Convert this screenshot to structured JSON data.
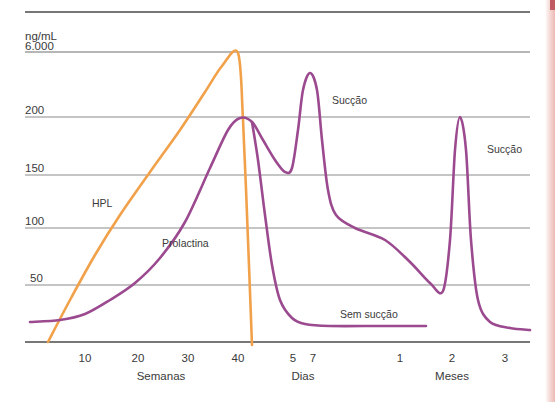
{
  "chart_data": {
    "type": "line",
    "title": "",
    "subtitle": "",
    "ylabel": "ng/mL",
    "yticks": [
      "6.000",
      "200",
      "150",
      "100",
      "50"
    ],
    "ytick_y": [
      52,
      117,
      175,
      228,
      285
    ],
    "ylim_note": "broken/non-linear axis: 6.000 at top, then 200,150,100,50",
    "grid": true,
    "legend_position": "inline-annotations",
    "x_sections": [
      {
        "name": "Semanas",
        "label": "Semanas",
        "ticks": [
          "10",
          "20",
          "30",
          "40"
        ],
        "tick_x": [
          85,
          138,
          188,
          238
        ]
      },
      {
        "name": "Dias",
        "label": "Dias",
        "ticks": [
          "5",
          "7"
        ],
        "tick_x": [
          293,
          313
        ]
      },
      {
        "name": "Meses",
        "label": "Meses",
        "ticks": [
          "1",
          "2",
          "3"
        ],
        "tick_x": [
          400,
          452,
          505
        ]
      }
    ],
    "series": [
      {
        "name": "HPL",
        "label": "HPL",
        "color": "#F2A14B",
        "label_x": 92,
        "label_y": 207,
        "description": "Rises from baseline at ~5 weeks, climbs steeply through 50/100/150/200, peaks at 6.000 at 40 weeks, then drops vertically to zero just after delivery.",
        "points": [
          {
            "x": 48,
            "y": 342
          },
          {
            "x": 70,
            "y": 300
          },
          {
            "x": 95,
            "y": 255
          },
          {
            "x": 120,
            "y": 215
          },
          {
            "x": 150,
            "y": 172
          },
          {
            "x": 180,
            "y": 130
          },
          {
            "x": 205,
            "y": 92
          },
          {
            "x": 222,
            "y": 66
          },
          {
            "x": 238,
            "y": 53
          },
          {
            "x": 243,
            "y": 120
          },
          {
            "x": 248,
            "y": 240
          },
          {
            "x": 252,
            "y": 345
          }
        ]
      },
      {
        "name": "Prolactina",
        "label": "Prolactina",
        "color": "#9B4A8F",
        "label_x": 162,
        "label_y": 247,
        "description": "Low baseline early pregnancy, rises from ~15 weeks, peaks at 200 ng/mL at term (40 weeks), falls after delivery; with suckling shows sharp spikes at day 7 and month 2; without suckling falls to low flat baseline.",
        "points": [
          {
            "x": 30,
            "y": 322
          },
          {
            "x": 60,
            "y": 320
          },
          {
            "x": 85,
            "y": 314
          },
          {
            "x": 110,
            "y": 300
          },
          {
            "x": 135,
            "y": 283
          },
          {
            "x": 160,
            "y": 258
          },
          {
            "x": 185,
            "y": 222
          },
          {
            "x": 210,
            "y": 168
          },
          {
            "x": 228,
            "y": 130
          },
          {
            "x": 240,
            "y": 118
          },
          {
            "x": 252,
            "y": 122
          },
          {
            "x": 263,
            "y": 140
          },
          {
            "x": 275,
            "y": 160
          },
          {
            "x": 285,
            "y": 172
          },
          {
            "x": 292,
            "y": 168
          },
          {
            "x": 298,
            "y": 130
          },
          {
            "x": 303,
            "y": 90
          },
          {
            "x": 310,
            "y": 73
          },
          {
            "x": 317,
            "y": 90
          },
          {
            "x": 322,
            "y": 140
          },
          {
            "x": 328,
            "y": 190
          },
          {
            "x": 336,
            "y": 215
          },
          {
            "x": 355,
            "y": 228
          },
          {
            "x": 385,
            "y": 240
          },
          {
            "x": 410,
            "y": 262
          },
          {
            "x": 430,
            "y": 283
          },
          {
            "x": 443,
            "y": 291
          },
          {
            "x": 450,
            "y": 240
          },
          {
            "x": 455,
            "y": 150
          },
          {
            "x": 460,
            "y": 117
          },
          {
            "x": 466,
            "y": 150
          },
          {
            "x": 471,
            "y": 240
          },
          {
            "x": 478,
            "y": 300
          },
          {
            "x": 490,
            "y": 322
          },
          {
            "x": 510,
            "y": 328
          },
          {
            "x": 530,
            "y": 330
          }
        ]
      },
      {
        "name": "Sem sucção",
        "label": "Sem sucção",
        "color": "#9B4A8F",
        "label_x": 340,
        "label_y": 318,
        "description": "Prolactin declines rapidly after delivery to a low flat baseline when there is no suckling.",
        "points": [
          {
            "x": 252,
            "y": 122
          },
          {
            "x": 258,
            "y": 160
          },
          {
            "x": 265,
            "y": 215
          },
          {
            "x": 272,
            "y": 265
          },
          {
            "x": 280,
            "y": 300
          },
          {
            "x": 292,
            "y": 318
          },
          {
            "x": 305,
            "y": 324
          },
          {
            "x": 330,
            "y": 326
          },
          {
            "x": 380,
            "y": 326
          },
          {
            "x": 426,
            "y": 326
          }
        ]
      }
    ],
    "annotations": [
      {
        "name": "succao-1",
        "text": "Sucção",
        "x": 332,
        "y": 104
      },
      {
        "name": "succao-2",
        "text": "Sucção",
        "x": 487,
        "y": 153
      }
    ]
  },
  "colors": {
    "hpl": "#F2A14B",
    "prolactin": "#9B4A8F",
    "grid": "#8c8c8c",
    "axis": "#4a4a4a",
    "text": "#3a3a3a",
    "edge_strip": "#edb9b4"
  }
}
